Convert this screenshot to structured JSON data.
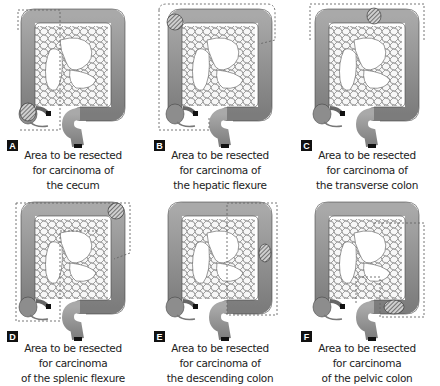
{
  "figure": {
    "panels": [
      {
        "label": "A",
        "caption": [
          "Area to be resected",
          "for carcinoma of",
          "the cecum"
        ],
        "tumor_site": "cecum"
      },
      {
        "label": "B",
        "caption": [
          "Area to be resected",
          "for carcinoma of",
          "the hepatic flexure"
        ],
        "tumor_site": "hepatic flexure"
      },
      {
        "label": "C",
        "caption": [
          "Area to be resected",
          "for carcinoma of",
          "the transverse colon"
        ],
        "tumor_site": "transverse colon"
      },
      {
        "label": "D",
        "caption": [
          "Area to be resected",
          "for carcinoma",
          "of the splenic flexure"
        ],
        "tumor_site": "splenic flexure"
      },
      {
        "label": "E",
        "caption": [
          "Area to be resected",
          "for carcinoma of",
          "the descending colon"
        ],
        "tumor_site": "descending colon"
      },
      {
        "label": "F",
        "caption": [
          "Area to be resected",
          "for carcinoma",
          "of the  pelvic colon"
        ],
        "tumor_site": "pelvic colon"
      }
    ],
    "colors": {
      "colon": "#8a8a8a",
      "colon_light": "#b5b5b5",
      "mesentery": "#f4f4f4",
      "outline": "#333333",
      "dashed": "#666666"
    }
  }
}
